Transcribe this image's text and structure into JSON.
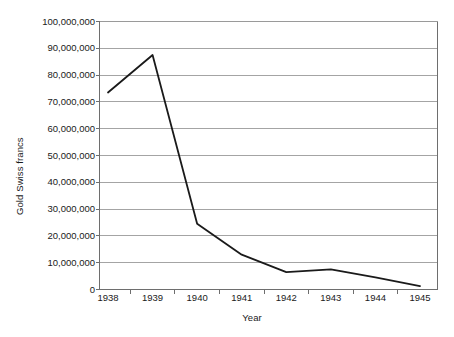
{
  "chart_data": {
    "type": "line",
    "title": "",
    "xlabel": "Year",
    "ylabel": "Gold Swiss francs",
    "categories": [
      "1938",
      "1939",
      "1940",
      "1941",
      "1942",
      "1943",
      "1944",
      "1945"
    ],
    "x": [
      1938,
      1939,
      1940,
      1941,
      1942,
      1943,
      1944,
      1945
    ],
    "values": [
      73500000,
      87500000,
      24500000,
      13000000,
      6500000,
      7500000,
      4500000,
      1300000
    ],
    "series": [
      {
        "name": "Gold Swiss francs",
        "values": [
          73500000,
          87500000,
          24500000,
          13000000,
          6500000,
          7500000,
          4500000,
          1300000
        ]
      }
    ],
    "ylim": [
      0,
      100000000
    ],
    "xlim": [
      1938,
      1945
    ],
    "ytick_values": [
      0,
      10000000,
      20000000,
      30000000,
      40000000,
      50000000,
      60000000,
      70000000,
      80000000,
      90000000,
      100000000
    ],
    "ytick_labels": [
      "0",
      "10,000,000",
      "20,000,000",
      "30,000,000",
      "40,000,000",
      "50,000,000",
      "60,000,000",
      "70,000,000",
      "80,000,000",
      "90,000,000",
      "100,000,000"
    ],
    "grid": true,
    "grid_axis": "y",
    "legend": false,
    "legend_position": "none",
    "line_color": "#1a1a1a",
    "grid_color": "#9a9a9a",
    "axis_color": "#6e6e6e",
    "background_color": "#ffffff",
    "line_width": 1.8
  }
}
